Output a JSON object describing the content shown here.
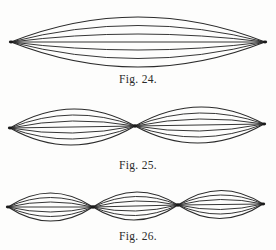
{
  "page": {
    "background": "#fdfdfc",
    "line_color": "#2b2b2b"
  },
  "figures": [
    {
      "id": "fig-24",
      "caption": "Fig. 24.",
      "segments": 1,
      "lines_per_segment": 7,
      "description": "Vibrating string, fundamental mode: single loop between two fixed end nodes",
      "nodes": [
        [
          11,
          42
        ],
        [
          265,
          42
        ]
      ],
      "half_amplitudes": [
        25,
        16.5,
        8,
        0,
        -8,
        -16.5,
        -25
      ]
    },
    {
      "id": "fig-25",
      "caption": "Fig. 25.",
      "segments": 2,
      "lines_per_segment": 7,
      "description": "Vibrating string, second mode: two loops with a central node",
      "nodes": [
        [
          10,
          128
        ],
        [
          135,
          126
        ],
        [
          264,
          124
        ]
      ],
      "half_amplitudes": [
        18,
        12,
        6,
        0,
        -6,
        -12,
        -18
      ]
    },
    {
      "id": "fig-26",
      "caption": "Fig. 26.",
      "segments": 3,
      "lines_per_segment": 7,
      "description": "Vibrating string, third mode: three loops with two intermediate nodes",
      "nodes": [
        [
          8,
          207
        ],
        [
          93,
          207
        ],
        [
          178,
          205
        ],
        [
          263,
          204
        ]
      ],
      "half_amplitudes": [
        14,
        9.5,
        5,
        0,
        -5,
        -9.5,
        -14
      ]
    }
  ]
}
